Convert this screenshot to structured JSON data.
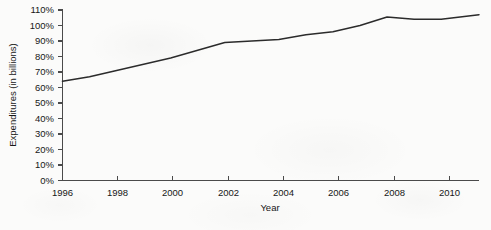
{
  "chart_data": {
    "type": "line",
    "title": "",
    "xlabel": "Year",
    "ylabel": "Expenditures (in billions)",
    "xlim": [
      1996,
      2011.4
    ],
    "ylim": [
      0,
      110
    ],
    "grid": false,
    "legend": null,
    "x_tick_labels": [
      "1996",
      "1998",
      "2000",
      "2002",
      "2004",
      "2006",
      "2008",
      "2010"
    ],
    "x_ticks": [
      1996,
      1998,
      2000,
      2002,
      2004,
      2006,
      2008,
      2010
    ],
    "y_tick_labels": [
      "0%",
      "10%",
      "20%",
      "30%",
      "40%",
      "50%",
      "60%",
      "70%",
      "80%",
      "90%",
      "100%",
      "110%"
    ],
    "y_ticks": [
      0,
      10,
      20,
      30,
      40,
      50,
      60,
      70,
      80,
      90,
      100,
      110
    ],
    "series": [
      {
        "name": "Expenditures",
        "color": "#2b2b2b",
        "x": [
          1996,
          1997,
          1998,
          1999,
          2000,
          2001,
          2002,
          2003,
          2004,
          2005,
          2006,
          2007,
          2008,
          2009,
          2010,
          2011.4
        ],
        "values": [
          64,
          67,
          71,
          75,
          79,
          84,
          89,
          90,
          91,
          94,
          96,
          100,
          105.5,
          104,
          104,
          107
        ]
      }
    ]
  },
  "axis": {
    "x_title": "Year",
    "y_title": "Expenditures (in billions)"
  }
}
